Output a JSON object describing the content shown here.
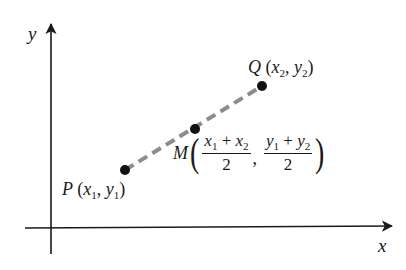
{
  "diagram": {
    "axes": {
      "x_label": "x",
      "y_label": "y",
      "axis_color": "#1a1a1a"
    },
    "segment": {
      "style": "dashed",
      "color": "#8c8c8c"
    },
    "points": [
      {
        "name": "P",
        "coords": "(x1, y1)",
        "x_sub": "1",
        "y_sub": "1",
        "px": 125,
        "py": 170
      },
      {
        "name": "M",
        "coords": "((x1 + x2)/2, (y1 + y2)/2)",
        "px": 195,
        "py": 129
      },
      {
        "name": "Q",
        "coords": "(x2, y2)",
        "x_sub": "2",
        "y_sub": "2",
        "px": 262,
        "py": 86
      }
    ],
    "labels": {
      "P": {
        "letter": "P",
        "open": "(",
        "x": "x",
        "x_sub": "1",
        "comma": ",",
        "y": "y",
        "y_sub": "1",
        "close": ")"
      },
      "Q": {
        "letter": "Q",
        "open": "(",
        "x": "x",
        "x_sub": "2",
        "comma": ",",
        "y": "y",
        "y_sub": "2",
        "close": ")"
      },
      "M": {
        "letter": "M",
        "open": "(",
        "close": ")",
        "frac1": {
          "a": "x",
          "a_sub": "1",
          "op": " + ",
          "b": "x",
          "b_sub": "2",
          "den": "2"
        },
        "comma": ",",
        "frac2": {
          "a": "y",
          "a_sub": "1",
          "op": " + ",
          "b": "y",
          "b_sub": "2",
          "den": "2"
        }
      }
    }
  }
}
